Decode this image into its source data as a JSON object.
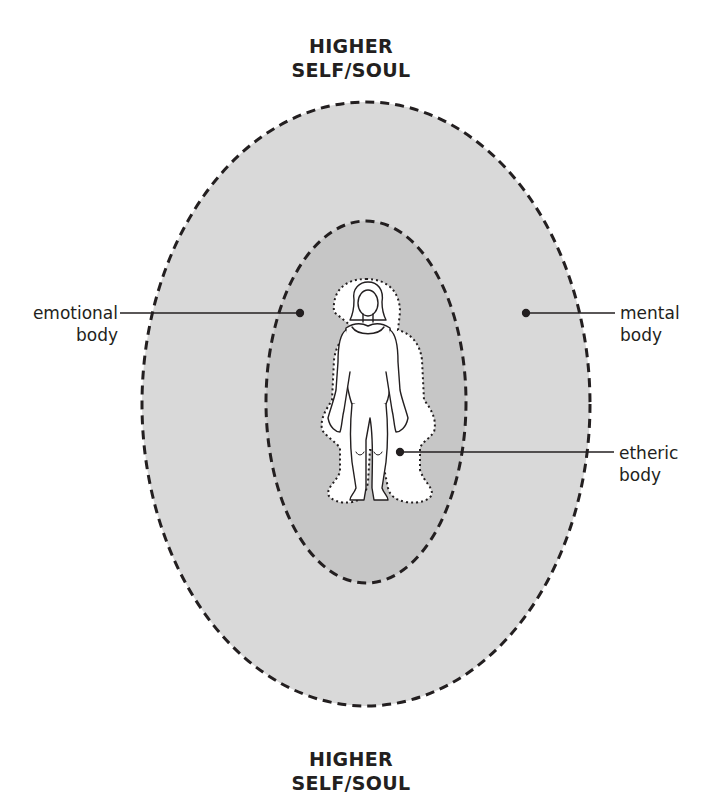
{
  "diagram": {
    "title_top": {
      "line1": "HIGHER",
      "line2": "SELF/SOUL"
    },
    "title_bottom": {
      "line1": "HIGHER",
      "line2": "SELF/SOUL"
    },
    "labels": {
      "emotional": {
        "line1": "emotional",
        "line2": "body"
      },
      "mental": {
        "line1": "mental",
        "line2": "body"
      },
      "etheric": {
        "line1": "etheric",
        "line2": "body"
      }
    },
    "layers": [
      {
        "name": "mental body (outer field)",
        "fill": "#d9d9d9"
      },
      {
        "name": "emotional body (inner field)",
        "fill": "#c6c6c6"
      },
      {
        "name": "etheric body (aura outline)",
        "fill": "#ffffff"
      }
    ],
    "colors": {
      "outline": "#231f20",
      "outer_fill": "#d9d9d9",
      "inner_fill": "#c6c6c6",
      "background": "#ffffff"
    }
  }
}
